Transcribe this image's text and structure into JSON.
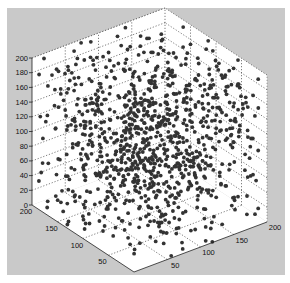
{
  "chart_data": {
    "type": "scatter3d",
    "title": "",
    "xlabel": "",
    "ylabel": "",
    "zlabel": "",
    "xlim": [
      0,
      200
    ],
    "ylim": [
      0,
      200
    ],
    "zlim": [
      0,
      200
    ],
    "x_ticks": [
      "50",
      "100",
      "150",
      "200"
    ],
    "y_ticks": [
      "200",
      "150",
      "100",
      "50"
    ],
    "z_ticks": [
      "0",
      "20",
      "40",
      "60",
      "80",
      "100",
      "120",
      "140",
      "160",
      "180",
      "200"
    ],
    "grid": true,
    "grid_style": "dotted",
    "legend": null,
    "marker": "filled circle",
    "marker_color": "#333333",
    "approx_point_count": 1000,
    "distribution": "uniform random in [0,200]^3",
    "seed": 12345
  },
  "colors": {
    "panel_background": "#c9c9c9",
    "axes_background": "#ffffff",
    "grid": "#444444",
    "marker": "#333333"
  }
}
